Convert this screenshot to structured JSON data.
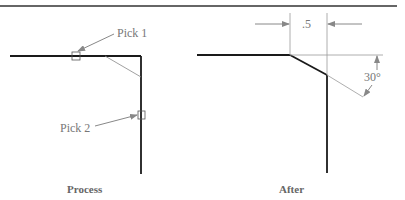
{
  "colors": {
    "outline": "#1a1a1a",
    "annotation": "#888888",
    "text": "#777777",
    "caption": "#666666"
  },
  "process_panel": {
    "caption": "Process",
    "pick1_label": "Pick 1",
    "pick2_label": "Pick 2"
  },
  "after_panel": {
    "caption": "After",
    "dimension_label": ".5",
    "angle_label": "30°"
  }
}
